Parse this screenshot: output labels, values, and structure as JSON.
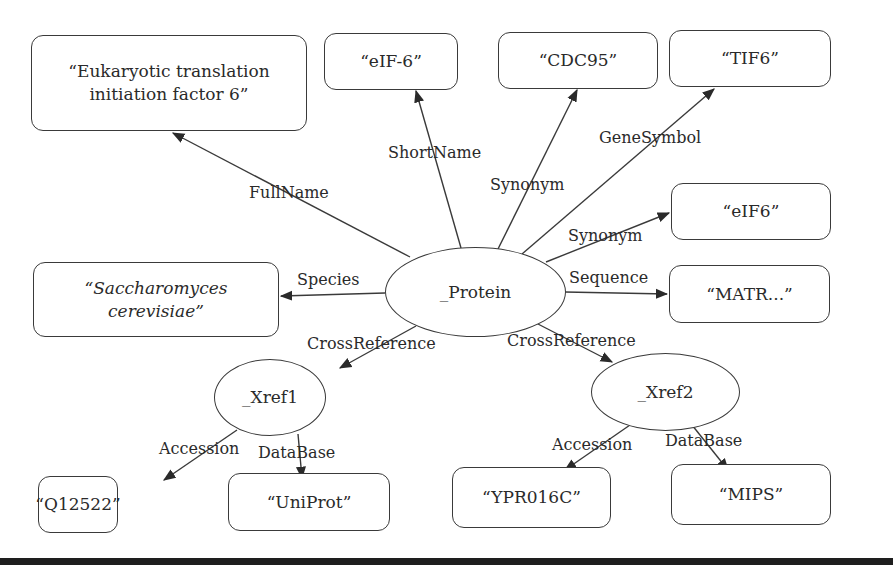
{
  "diagram": {
    "nodes": {
      "protein": "_Protein",
      "xref1": "_Xref1",
      "xref2": "_Xref2",
      "fullname": "“Eukaryotic translation initiation factor 6”",
      "fullname_line1": "“Eukaryotic translation",
      "fullname_line2": "initiation factor 6”",
      "shortname": "“eIF-6”",
      "synonym1": "“CDC95”",
      "genesymbol": "“TIF6”",
      "synonym2": "“eIF6”",
      "species_line1": "“Saccharomyces",
      "species_line2": "cerevisiae”",
      "sequence": "“MATR...”",
      "accession1": "“Q12522”",
      "database1": "“UniProt”",
      "accession2": "“YPR016C”",
      "database2": "“MIPS”"
    },
    "edges": {
      "fullname": "FullName",
      "shortname": "ShortName",
      "synonym1": "Synonym",
      "genesymbol": "GeneSymbol",
      "synonym2": "Synonym",
      "species": "Species",
      "sequence": "Sequence",
      "crossref1": "CrossReference",
      "crossref2": "CrossReference",
      "accession1": "Accession",
      "database1": "DataBase",
      "accession2": "Accession",
      "database2": "DataBase"
    },
    "colors": {
      "stroke": "#3a3a3a",
      "text": "#2a2a2a",
      "rule": "#1e1e1e"
    }
  }
}
